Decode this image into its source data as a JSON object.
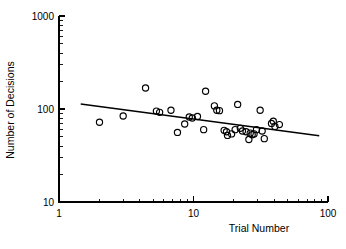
{
  "chart_data": {
    "type": "scatter",
    "title": "",
    "xlabel": "Trial Number",
    "ylabel": "Number of Decisions",
    "xscale": "log",
    "yscale": "log",
    "xlim": [
      1,
      100
    ],
    "ylim": [
      10,
      1000
    ],
    "grid": false,
    "legend": null,
    "legend_position": "none",
    "marker": "open-circle",
    "marker_color": "#000000",
    "xticks": [
      1,
      10,
      100
    ],
    "xtick_labels": [
      "1",
      "10",
      "100"
    ],
    "yticks": [
      10,
      100,
      1000
    ],
    "ytick_labels": [
      "10",
      "100",
      "1000"
    ],
    "minor_ticks": true,
    "series": [
      {
        "name": "Decisions per trial",
        "marker": "open-circle",
        "points": [
          [
            2.0,
            72
          ],
          [
            3.0,
            84
          ],
          [
            4.4,
            168
          ],
          [
            5.3,
            95
          ],
          [
            5.6,
            92
          ],
          [
            6.8,
            97
          ],
          [
            7.6,
            56
          ],
          [
            8.6,
            69
          ],
          [
            9.3,
            82
          ],
          [
            9.8,
            80
          ],
          [
            10.7,
            83
          ],
          [
            11.9,
            60
          ],
          [
            12.3,
            155
          ],
          [
            14.3,
            108
          ],
          [
            14.9,
            97
          ],
          [
            15.6,
            96
          ],
          [
            16.9,
            59
          ],
          [
            17.6,
            57
          ],
          [
            17.9,
            52
          ],
          [
            19.2,
            54
          ],
          [
            20.4,
            60
          ],
          [
            21.3,
            112
          ],
          [
            22.3,
            62
          ],
          [
            23.1,
            58
          ],
          [
            24.6,
            57
          ],
          [
            25.8,
            47
          ],
          [
            26.4,
            55
          ],
          [
            27.3,
            53
          ],
          [
            28.2,
            54
          ],
          [
            29.4,
            60
          ],
          [
            31.3,
            97
          ],
          [
            32.4,
            58
          ],
          [
            33.6,
            48
          ],
          [
            38.0,
            70
          ],
          [
            39.2,
            74
          ],
          [
            40.3,
            65
          ],
          [
            43.5,
            68
          ]
        ]
      }
    ],
    "fit_line": {
      "name": "regression-line",
      "x_start": 1.45,
      "y_start": 113,
      "x_end": 86.0,
      "y_end": 51.5
    },
    "annotations": []
  },
  "axes": {
    "x_axis_title": "Trial Number",
    "y_axis_title": "Number of Decisions",
    "x_tick_labels": [
      "1",
      "10",
      "100"
    ],
    "y_tick_labels": [
      "1000",
      "100",
      "10"
    ]
  }
}
